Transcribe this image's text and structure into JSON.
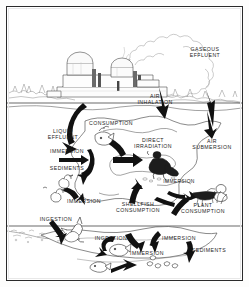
{
  "figure": {
    "frame": {
      "border_color": "#2b2b2b",
      "background": "#ffffff"
    },
    "ink_color": "#1d1d1d",
    "sky_color": "#ffffff",
    "water_color": "#ffffff"
  },
  "labels": [
    {
      "id": "gaseous-effluent",
      "text": "GASEOUS\nEFFLUENT",
      "x": 198,
      "y": 45,
      "lines": 2
    },
    {
      "id": "air-inhalation",
      "text": "AIR\nINHALATION",
      "x": 148,
      "y": 92,
      "lines": 2
    },
    {
      "id": "consumption",
      "text": "CONSUMPTION",
      "x": 104,
      "y": 116,
      "lines": 1
    },
    {
      "id": "liquid-effluent",
      "text": "LIQUID\nEFFLUENT",
      "x": 56,
      "y": 127,
      "lines": 2
    },
    {
      "id": "immersion-shore",
      "text": "IMMERSION",
      "x": 60,
      "y": 144,
      "lines": 1
    },
    {
      "id": "direct-irradiation",
      "text": "DIRECT\nIRRADIATION",
      "x": 146,
      "y": 136,
      "lines": 2
    },
    {
      "id": "air-submersion",
      "text": "AIR\nSUBMERSION",
      "x": 205,
      "y": 137,
      "lines": 2
    },
    {
      "id": "sediments-left",
      "text": "SEDIMENTS",
      "x": 60,
      "y": 161,
      "lines": 1
    },
    {
      "id": "immersion-boat",
      "text": "IMMERSION",
      "x": 172,
      "y": 175,
      "lines": 1
    },
    {
      "id": "immersion-duck",
      "text": "IMMERSION",
      "x": 77,
      "y": 194,
      "lines": 1
    },
    {
      "id": "shellfish-consumption",
      "text": "SHELLFISH\nCONSUMPTION",
      "x": 131,
      "y": 200,
      "lines": 2
    },
    {
      "id": "plant-consumption",
      "text": "PLANT\nCONSUMPTION",
      "x": 196,
      "y": 201,
      "lines": 2
    },
    {
      "id": "ingestion-bird",
      "text": "INGESTION",
      "x": 49,
      "y": 212,
      "lines": 1
    },
    {
      "id": "ingestion-fish",
      "text": "INGESTION",
      "x": 104,
      "y": 231,
      "lines": 1
    },
    {
      "id": "immersion-water",
      "text": "IMMERSION",
      "x": 172,
      "y": 231,
      "lines": 1
    },
    {
      "id": "immersion-bottom",
      "text": "IMMERSION",
      "x": 140,
      "y": 246,
      "lines": 1
    },
    {
      "id": "sediments-bottom",
      "text": "SEDIMENTS",
      "x": 202,
      "y": 243,
      "lines": 1
    }
  ],
  "scene": {
    "power_plant": "nuclear power station with two containment domes and stacks",
    "plume": "large billowing gaseous effluent cloud rising to the right",
    "shoreline": "horizontal shoreline across the middle of the frame",
    "water_body": "open water with arrows showing exposure pathways",
    "wildlife": [
      "waterfowl",
      "fish",
      "shellfish",
      "aquatic plants"
    ],
    "people": [
      "person on beach",
      "person in boat"
    ]
  }
}
